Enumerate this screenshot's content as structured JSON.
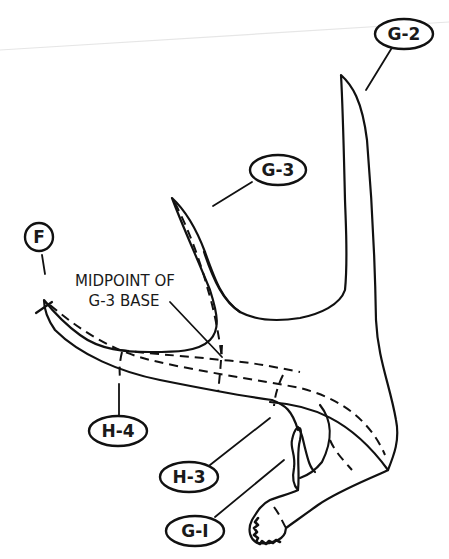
{
  "diagram": {
    "labels": {
      "g2": "G-2",
      "g3": "G-3",
      "f": "F",
      "h4": "H-4",
      "h3": "H-3",
      "g1": "G-I"
    },
    "annotation": {
      "line1": "MIDPOINT OF",
      "line2": "G-3 BASE"
    },
    "colors": {
      "ink": "#111111",
      "background": "#ffffff"
    }
  }
}
